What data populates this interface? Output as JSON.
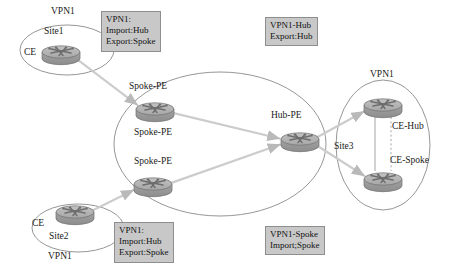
{
  "diagram": {
    "colors": {
      "router_body": "#9e9e9e",
      "router_top": "#b5b5b5",
      "router_outline": "#6f6f6f",
      "ellipse_stroke": "#8a8a8a",
      "link": "#cccccc",
      "link_solid": "#9a9a9a",
      "note_bg": "#c8c8c8",
      "note_border": "#8e8e8e",
      "text": "#1a1a1a"
    },
    "notes": [
      {
        "id": "note-spoke-site1",
        "lines": [
          "VPN1:",
          "Import:Hub",
          "Export:Spoke"
        ],
        "x": 101,
        "y": 11
      },
      {
        "id": "note-hub",
        "lines": [
          "VPN1-Hub",
          "Export:Hub"
        ],
        "x": 265,
        "y": 17
      },
      {
        "id": "note-spoke-site2",
        "lines": [
          "VPN1:",
          "Import:Hub",
          "Export:Spoke"
        ],
        "x": 114,
        "y": 222
      },
      {
        "id": "note-spoke",
        "lines": [
          "VPN1-Spoke",
          "Import;Spoke"
        ],
        "x": 265,
        "y": 226
      }
    ],
    "labels": [
      {
        "id": "label-vpn1-site1",
        "text": "VPN1",
        "x": 51,
        "y": 7
      },
      {
        "id": "label-site1",
        "text": "Site1",
        "x": 44,
        "y": 27
      },
      {
        "id": "label-ce-site1",
        "text": "CE",
        "x": 24,
        "y": 48
      },
      {
        "id": "label-spoke-pe-1",
        "text": "Spoke-PE",
        "x": 129,
        "y": 82
      },
      {
        "id": "label-spoke-pe-2",
        "text": "Spoke-PE",
        "x": 134,
        "y": 128
      },
      {
        "id": "label-spoke-pe-3",
        "text": "Spoke-PE",
        "x": 134,
        "y": 157
      },
      {
        "id": "label-hub-pe",
        "text": "Hub-PE",
        "x": 271,
        "y": 111
      },
      {
        "id": "label-vpn1-site3",
        "text": "VPN1",
        "x": 370,
        "y": 70
      },
      {
        "id": "label-ce-hub",
        "text": "CE-Hub",
        "x": 392,
        "y": 122
      },
      {
        "id": "label-site3",
        "text": "Site3",
        "x": 334,
        "y": 142
      },
      {
        "id": "label-ce-spoke",
        "text": "CE-Spoke",
        "x": 390,
        "y": 156
      },
      {
        "id": "label-ce-site2",
        "text": "CE",
        "x": 32,
        "y": 219
      },
      {
        "id": "label-site2",
        "text": "Site2",
        "x": 49,
        "y": 232
      },
      {
        "id": "label-vpn1-site2",
        "text": "VPN1",
        "x": 48,
        "y": 252
      }
    ],
    "routers": [
      {
        "id": "router-ce-site1",
        "name": "CE-Site1",
        "cx": 61,
        "cy": 54
      },
      {
        "id": "router-spoke-pe-1",
        "name": "Spoke-PE-1",
        "cx": 155,
        "cy": 111
      },
      {
        "id": "router-spoke-pe-2",
        "name": "Spoke-PE-2",
        "cx": 153,
        "cy": 186
      },
      {
        "id": "router-hub-pe",
        "name": "Hub-PE",
        "cx": 300,
        "cy": 141
      },
      {
        "id": "router-ce-hub",
        "name": "CE-Hub",
        "cx": 383,
        "cy": 107
      },
      {
        "id": "router-ce-spoke",
        "name": "CE-Spoke",
        "cx": 383,
        "cy": 181
      },
      {
        "id": "router-ce-site2",
        "name": "CE-Site2",
        "cx": 75,
        "cy": 214
      }
    ],
    "clouds": [
      {
        "id": "cloud-site1",
        "cx": 67,
        "cy": 50,
        "rx": 47,
        "ry": 25
      },
      {
        "id": "cloud-backbone",
        "cx": 220,
        "cy": 144,
        "rx": 106,
        "ry": 72
      },
      {
        "id": "cloud-site3",
        "cx": 383,
        "cy": 145,
        "rx": 47,
        "ry": 65
      },
      {
        "id": "cloud-site2",
        "cx": 78,
        "cy": 228,
        "rx": 46,
        "ry": 24
      }
    ],
    "links": [
      {
        "id": "link-ce1-spoke1",
        "from": "CE-Site1",
        "to": "Spoke-PE-1",
        "style": "arrow"
      },
      {
        "id": "link-spoke1-hub",
        "from": "Spoke-PE-1",
        "to": "Hub-PE",
        "style": "arrow"
      },
      {
        "id": "link-spoke2-hub",
        "from": "Spoke-PE-2",
        "to": "Hub-PE",
        "style": "arrow"
      },
      {
        "id": "link-ce2-spoke2",
        "from": "CE-Site2",
        "to": "Spoke-PE-2",
        "style": "arrow"
      },
      {
        "id": "link-hub-cehub",
        "from": "Hub-PE",
        "to": "CE-Hub",
        "style": "arrow"
      },
      {
        "id": "link-hub-cespoke",
        "from": "Hub-PE",
        "to": "CE-Spoke",
        "style": "arrow"
      },
      {
        "id": "link-cehub-cespoke-solid",
        "from": "CE-Hub",
        "to": "CE-Spoke",
        "style": "solid"
      },
      {
        "id": "link-cehub-cespoke-dashed",
        "from": "CE-Hub",
        "to": "CE-Spoke",
        "style": "dashed"
      }
    ]
  }
}
